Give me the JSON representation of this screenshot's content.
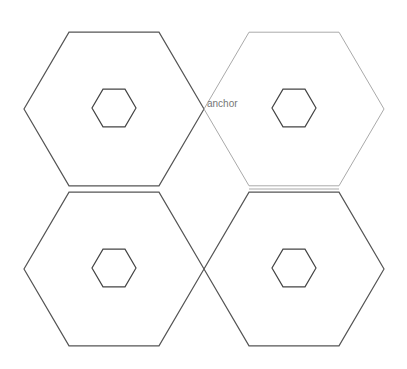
{
  "diagram": {
    "background": "#ffffff",
    "outer_hexagons": [
      {
        "id": "top-left",
        "cx": 114,
        "cy": 109,
        "r": 90,
        "stroke": "#555555",
        "stroke_width": 1.2
      },
      {
        "id": "top-right",
        "cx": 294,
        "cy": 109,
        "r": 90,
        "stroke": "#aaaaaa",
        "stroke_width": 1.0
      },
      {
        "id": "bottom-left",
        "cx": 114,
        "cy": 269,
        "r": 90,
        "stroke": "#555555",
        "stroke_width": 1.2
      },
      {
        "id": "bottom-right",
        "cx": 294,
        "cy": 269,
        "r": 90,
        "stroke": "#555555",
        "stroke_width": 1.2
      }
    ],
    "inner_hexagons": [
      {
        "id": "top-left-inner",
        "cx": 114,
        "cy": 108,
        "r": 22,
        "stroke": "#444444",
        "stroke_width": 1.2
      },
      {
        "id": "top-right-inner",
        "cx": 294,
        "cy": 108,
        "r": 22,
        "stroke": "#444444",
        "stroke_width": 1.2
      },
      {
        "id": "bottom-left-inner",
        "cx": 114,
        "cy": 268,
        "r": 22,
        "stroke": "#444444",
        "stroke_width": 1.2
      },
      {
        "id": "bottom-right-inner",
        "cx": 294,
        "cy": 268,
        "r": 22,
        "stroke": "#444444",
        "stroke_width": 1.2
      }
    ],
    "shared_edge": {
      "x1": 249,
      "y1": 189,
      "x2": 339,
      "y2": 189,
      "stroke": "#aaaaaa"
    },
    "anchor_label": {
      "text": "anchor",
      "x": 207,
      "y": 99,
      "color": "#777777"
    }
  }
}
